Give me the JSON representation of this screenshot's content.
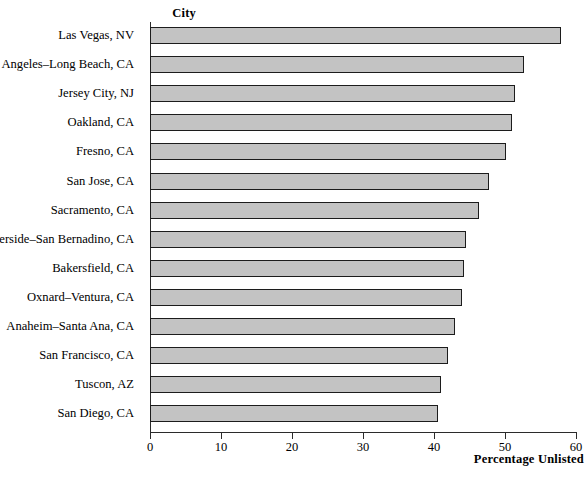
{
  "chart_data": {
    "type": "bar",
    "orientation": "horizontal",
    "title": "",
    "xlabel": "Percentage Unlisted",
    "ylabel": "City",
    "xlim": [
      0,
      60
    ],
    "xticks": [
      0,
      10,
      20,
      30,
      40,
      50,
      60
    ],
    "grid": false,
    "legend": null,
    "bar_color": "#c3c3c3",
    "bar_edge_color": "#1c1c1c",
    "categories": [
      "Las Vegas, NV",
      "Los Angeles–Long Beach, CA",
      "Jersey City, NJ",
      "Oakland, CA",
      "Fresno, CA",
      "San Jose, CA",
      "Sacramento, CA",
      "Riverside–San Bernadino, CA",
      "Bakersfield, CA",
      "Oxnard–Ventura, CA",
      "Anaheim–Santa Ana, CA",
      "San Francisco, CA",
      "Tuscon, AZ",
      "San Diego, CA"
    ],
    "values": [
      57.9,
      52.7,
      51.4,
      51.0,
      50.1,
      47.8,
      46.3,
      44.5,
      44.2,
      43.9,
      42.9,
      42.0,
      41.0,
      40.5
    ]
  }
}
